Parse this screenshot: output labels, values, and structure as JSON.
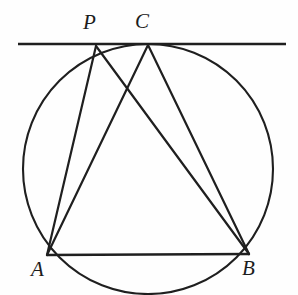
{
  "figure": {
    "background_color": "#fefefe",
    "stroke_color": "#1f1f1f",
    "canvas": {
      "width": 298,
      "height": 295
    },
    "points": [
      {
        "id": "P",
        "label": "P",
        "x": 96,
        "y": 46,
        "label_x": 83,
        "label_y": 12,
        "on": "tangent-line"
      },
      {
        "id": "C",
        "label": "C",
        "x": 148,
        "y": 45,
        "label_x": 135,
        "label_y": 11,
        "on": "tangent-point"
      },
      {
        "id": "A",
        "label": "A",
        "x": 47,
        "y": 255,
        "label_x": 31,
        "label_y": 259,
        "on": "circle"
      },
      {
        "id": "B",
        "label": "B",
        "x": 249,
        "y": 254,
        "label_x": 242,
        "label_y": 258,
        "on": "circle"
      }
    ],
    "circle": {
      "cx": 148,
      "cy": 169,
      "r": 125,
      "stroke_width": 2.1
    },
    "tangent_line": {
      "x1": 18,
      "y1": 44,
      "x2": 286,
      "y2": 44,
      "stroke_width": 2.6
    },
    "segments": [
      {
        "id": "PA",
        "from": "P",
        "to": "A",
        "x1": 96,
        "y1": 46,
        "x2": 47,
        "y2": 255,
        "stroke_width": 2.2
      },
      {
        "id": "PB",
        "from": "P",
        "to": "B",
        "x1": 96,
        "y1": 46,
        "x2": 249,
        "y2": 254,
        "stroke_width": 2.2
      },
      {
        "id": "CA",
        "from": "C",
        "to": "A",
        "x1": 148,
        "y1": 45,
        "x2": 47,
        "y2": 255,
        "stroke_width": 2.2
      },
      {
        "id": "CB",
        "from": "C",
        "to": "B",
        "x1": 148,
        "y1": 45,
        "x2": 249,
        "y2": 254,
        "stroke_width": 2.2
      },
      {
        "id": "AB",
        "from": "A",
        "to": "B",
        "x1": 47,
        "y1": 255,
        "x2": 249,
        "y2": 254,
        "stroke_width": 2.4
      }
    ]
  }
}
